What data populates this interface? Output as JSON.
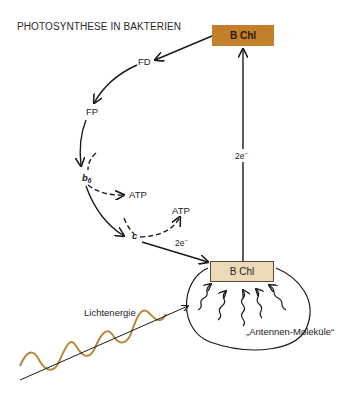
{
  "title": "PHOTOSYNTHESE IN BAKTERIEN",
  "nodes": {
    "bchl_top": "B Chl",
    "fd": "FD",
    "fp": "FP",
    "b6_base": "b",
    "b6_sub": "6",
    "atp1": "ATP",
    "atp2": "ATP",
    "c": "c",
    "bchl_bottom": "B Chl"
  },
  "labels": {
    "electrons_vertical_base": "2e",
    "electrons_vertical_sup": "−",
    "electrons_diag_base": "2e",
    "electrons_diag_sup": "−",
    "light_energy": "Lichtenergie",
    "antenna": "„Antennen-Moleküle“"
  },
  "colors": {
    "bchl_top_fill": "#c47f2c",
    "bchl_bottom_fill": "#ecd9b6",
    "light_wave": "#b58a3e",
    "stroke": "#1a1a1a"
  }
}
